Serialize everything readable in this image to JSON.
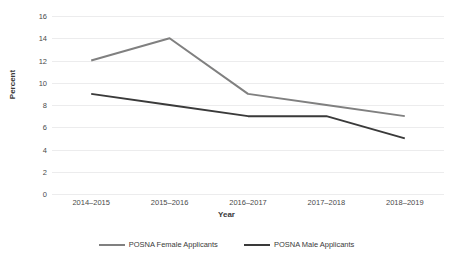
{
  "chart_data": {
    "type": "line",
    "title": "",
    "xlabel": "Year",
    "ylabel": "Percent",
    "categories": [
      "2014–2015",
      "2015–2016",
      "2016–2017",
      "2017–2018",
      "2018–2019"
    ],
    "series": [
      {
        "name": "POSNA Female Applicants",
        "values": [
          12,
          14,
          9,
          8,
          7
        ],
        "color": "#808080"
      },
      {
        "name": "POSNA Male Applicants",
        "values": [
          9,
          8,
          7,
          7,
          5
        ],
        "color": "#3a3a3a"
      }
    ],
    "ylim": [
      0,
      16
    ],
    "yticks": [
      0,
      2,
      4,
      6,
      8,
      10,
      12,
      14,
      16
    ],
    "ytick_labels": [
      "0",
      "2",
      "4",
      "6",
      "8",
      "10",
      "12",
      "14",
      "16"
    ],
    "grid": true,
    "grid_color": "#ececed",
    "legend_position": "bottom",
    "background": "#ffffff"
  }
}
